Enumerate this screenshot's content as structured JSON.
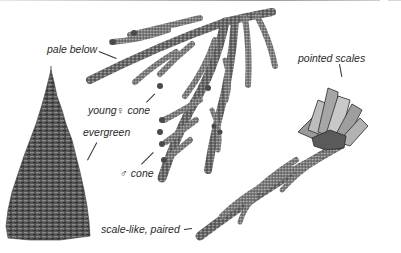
{
  "figure": {
    "labels": {
      "pale_below": "pale below",
      "young_female_cone": "young♀ cone",
      "evergreen": "evergreen",
      "male_cone": "♂ cone",
      "pointed_scales": "pointed scales",
      "scale_like_paired": "scale-like, paired"
    },
    "colors": {
      "background": "#ffffff",
      "foliage_dark": "#4a4a4a",
      "foliage_mid": "#7a7a7a",
      "foliage_light": "#a8a8a8",
      "text": "#2b2b2b"
    }
  }
}
